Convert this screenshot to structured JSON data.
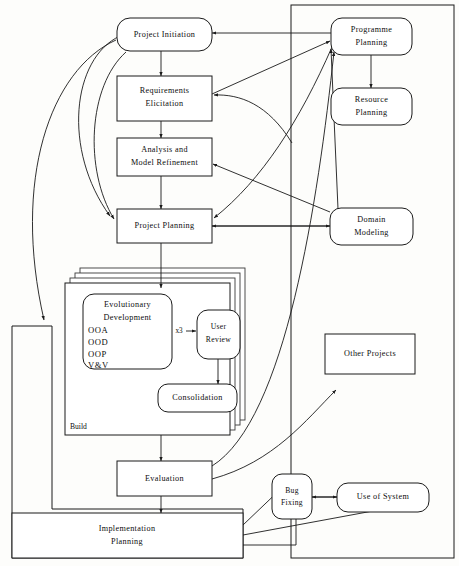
{
  "diagram": {
    "colors": {
      "stroke": "#1a1a1a",
      "fill": "#ffffff",
      "background": "#fdfdfb"
    },
    "nodes": {
      "project_initiation": "Project Initiation",
      "requirements_elicitation_line1": "Requirements",
      "requirements_elicitation_line2": "Elicitation",
      "analysis_line1": "Analysis and",
      "analysis_line2": "Model Refinement",
      "project_planning": "Project Planning",
      "programme_planning_line1": "Programme",
      "programme_planning_line2": "Planning",
      "resource_planning_line1": "Resource",
      "resource_planning_line2": "Planning",
      "domain_modeling_line1": "Domain",
      "domain_modeling_line2": "Modeling",
      "other_projects": "Other Projects",
      "evolutionary_line1": "Evolutionary",
      "evolutionary_line2": "Development",
      "ooa": "OOA",
      "ood": "OOD",
      "oop": "OOP",
      "vandv": "V&V",
      "user_review_line1": "User",
      "user_review_line2": "Review",
      "consolidation": "Consolidation",
      "build_label": "Build",
      "iteration_label": "x3",
      "evaluation": "Evaluation",
      "implementation_line1": "Implementation",
      "implementation_line2": "Planning",
      "bug_fixing_line1": "Bug",
      "bug_fixing_line2": "Fixing",
      "use_of_system": "Use of System"
    }
  }
}
